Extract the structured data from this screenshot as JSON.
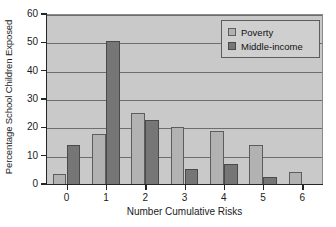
{
  "chart_data": {
    "type": "bar",
    "title": "",
    "xlabel": "Number Cumulative Risks",
    "ylabel": "Percentage School Children Exposed",
    "categories": [
      "0",
      "1",
      "2",
      "3",
      "4",
      "5",
      "6"
    ],
    "series": [
      {
        "name": "Poverty",
        "values": [
          4,
          18,
          25.5,
          20.5,
          19,
          14,
          4.5
        ]
      },
      {
        "name": "Middle-income",
        "values": [
          14,
          51,
          23,
          5.5,
          7.5,
          3,
          null
        ]
      }
    ],
    "ylim": [
      0,
      60
    ],
    "yticks": [
      0,
      10,
      20,
      30,
      40,
      50,
      60
    ],
    "ytick_labels": [
      "0",
      "10",
      "20",
      "30",
      "40",
      "50",
      "60"
    ],
    "grid": true,
    "legend_position": "top-right",
    "colors": {
      "poverty": "#b2b2b2",
      "middle_income": "#767676",
      "plot_background": "#c9c9c9",
      "axis": "#262626",
      "gridline": "#6e6e6e",
      "legend_background": "#cfcfcf"
    }
  },
  "legend": {
    "entries": [
      {
        "label": "Poverty"
      },
      {
        "label": "Middle-income"
      }
    ]
  }
}
